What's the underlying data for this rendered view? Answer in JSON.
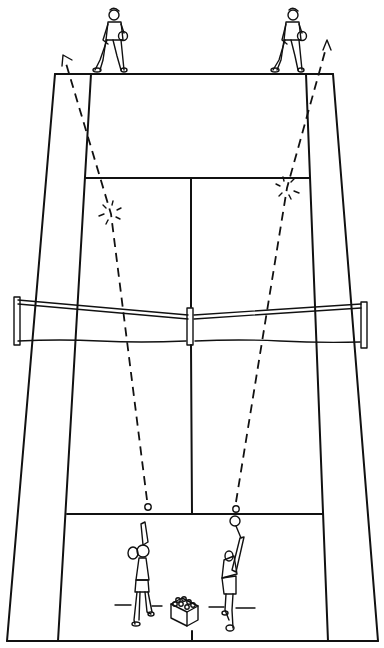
{
  "diagram": {
    "subject": "Tennis doubles drill diagram",
    "court": {
      "top_baseline": {
        "y": 74,
        "x1": 55,
        "x2": 333
      },
      "bottom_baseline": {
        "y": 641,
        "x1": 7,
        "x2": 378
      },
      "colors": {
        "line": "#111111",
        "background": "#ffffff"
      }
    },
    "players": [
      {
        "id": "far-left",
        "role": "receiver",
        "position": "far baseline left"
      },
      {
        "id": "far-right",
        "role": "receiver",
        "position": "far baseline right"
      },
      {
        "id": "near-left",
        "role": "server",
        "position": "near service area left"
      },
      {
        "id": "near-right",
        "role": "server",
        "position": "near service area right"
      }
    ],
    "ball_paths": [
      {
        "id": "path-left-to-far-left",
        "from": [
          147,
          507
        ],
        "bounce": [
          111,
          214
        ],
        "to": [
          63,
          56
        ]
      },
      {
        "id": "path-right-to-far-right",
        "from": [
          236,
          509
        ],
        "bounce": [
          287,
          188
        ],
        "to": [
          327,
          41
        ]
      }
    ],
    "props": [
      {
        "id": "ball-basket",
        "label": "ball basket"
      }
    ]
  }
}
